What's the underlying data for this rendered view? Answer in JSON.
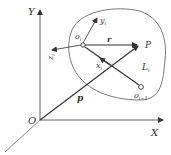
{
  "diagram": {
    "type": "coordinate-frame",
    "labels": {
      "y_axis": "Y",
      "x_axis": "X",
      "origin": "O",
      "local_origin": "o",
      "local_origin_sub": "i",
      "local_y": "y",
      "local_y_sub": "i",
      "local_z": "z",
      "local_z_sub": "i",
      "local_x": "x",
      "local_x_sub": "i",
      "vector_r": "r",
      "point_P": "P",
      "link": "L",
      "link_sub": "i",
      "prev_origin": "o",
      "prev_origin_sub": "i−1",
      "vector_p": "p"
    },
    "colors": {
      "line": "#444444",
      "text": "#333333",
      "background": "#ffffff"
    }
  }
}
